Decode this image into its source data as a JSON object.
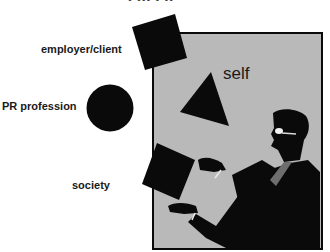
{
  "diagram": {
    "title_fragment": "• ••• • ••",
    "labels": {
      "employer_client": "employer/client",
      "pr_profession": "PR profession",
      "society": "society",
      "self": "self"
    },
    "shapes": [
      {
        "name": "employer-client-square",
        "type": "square",
        "color": "#0a0a0a"
      },
      {
        "name": "pr-profession-circle",
        "type": "circle",
        "color": "#0a0a0a"
      },
      {
        "name": "society-square",
        "type": "square",
        "color": "#0a0a0a"
      },
      {
        "name": "self-triangle",
        "type": "triangle",
        "color": "#0a0a0a"
      }
    ],
    "panel_color": "#b9b9b9",
    "figure": "juggling man silhouette with glasses"
  }
}
